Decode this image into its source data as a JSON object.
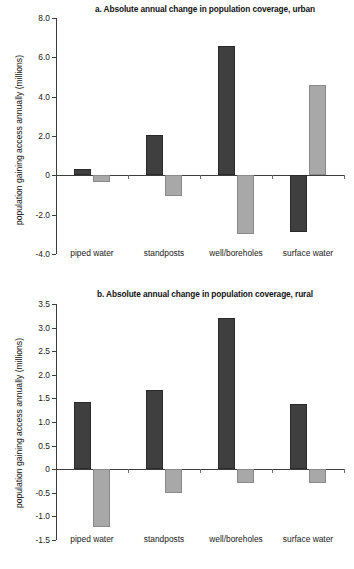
{
  "figure": {
    "ylabel": "population gaining access annually (millions)"
  },
  "chart_data": [
    {
      "type": "bar",
      "title": "a. Absolute annual change in population coverage, urban",
      "xlabel": "",
      "ylabel": "population gaining access annually (millions)",
      "categories": [
        "piped water",
        "standposts",
        "well/boreholes",
        "surface water"
      ],
      "series": [
        {
          "name": "dark",
          "color": "#3f3f3f",
          "values": [
            0.3,
            2.05,
            6.6,
            -2.9
          ]
        },
        {
          "name": "light",
          "color": "#a8a8a8",
          "values": [
            -0.35,
            -1.05,
            -3.0,
            4.6
          ]
        }
      ],
      "ylim": [
        -4.0,
        8.0
      ],
      "yticks": [
        8.0,
        6.0,
        4.0,
        2.0,
        0,
        -2.0,
        -4.0
      ],
      "ytick_labels": [
        "8.0",
        "6.0",
        "4.0",
        "2.0",
        "0",
        "-2.0",
        "-4.0"
      ],
      "grid": false,
      "legend": "none"
    },
    {
      "type": "bar",
      "title": "b. Absolute annual change in population coverage, rural",
      "xlabel": "",
      "ylabel": "population gaining access annually (millions)",
      "categories": [
        "piped water",
        "standposts",
        "well/boreholes",
        "surface water"
      ],
      "series": [
        {
          "name": "dark",
          "color": "#3f3f3f",
          "values": [
            1.42,
            1.68,
            3.21,
            1.38
          ]
        },
        {
          "name": "light",
          "color": "#a8a8a8",
          "values": [
            -1.22,
            -0.51,
            -0.29,
            -0.3
          ]
        }
      ],
      "ylim": [
        -1.5,
        3.5
      ],
      "yticks": [
        3.5,
        3.0,
        2.5,
        2.0,
        1.5,
        1.0,
        0.5,
        0,
        -0.5,
        -1.0,
        -1.5
      ],
      "ytick_labels": [
        "3.5",
        "3.0",
        "2.5",
        "2.0",
        "1.5",
        "1.0",
        "0.5",
        "0",
        "-0.5",
        "-1.0",
        "-1.5"
      ],
      "grid": false,
      "legend": "none"
    }
  ]
}
